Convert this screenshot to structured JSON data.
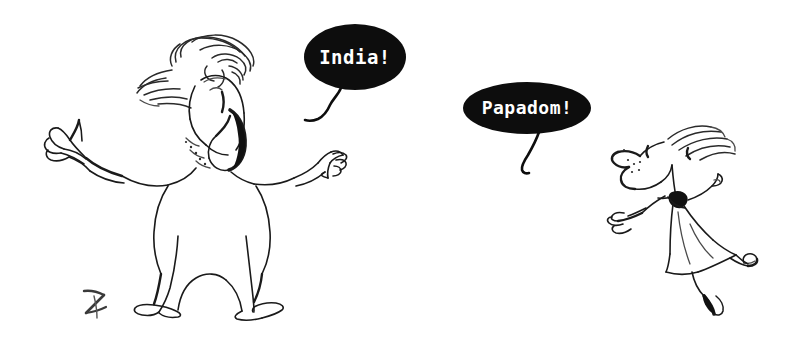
{
  "artwork": {
    "title": "India! / Papadom! cartoon sketch",
    "background_color": "#ffffff",
    "ink_color": "#1a1a1a",
    "width": 804,
    "height": 347
  },
  "speech_bubbles": [
    {
      "id": "bubble-india",
      "text": "India!",
      "fill_color": "#0d0d0d",
      "text_color": "#ffffff",
      "font_size": 19,
      "center_x": 355,
      "center_y": 57,
      "radius_x": 51,
      "radius_y": 33,
      "speaker": "adult-figure"
    },
    {
      "id": "bubble-papadom",
      "text": "Papadom!",
      "fill_color": "#0d0d0d",
      "text_color": "#ffffff",
      "font_size": 18,
      "center_x": 527,
      "center_y": 108,
      "radius_x": 64,
      "radius_y": 26,
      "speaker": "child-figure"
    }
  ],
  "figures": [
    {
      "id": "adult-figure",
      "label": "Adult figure shouting with arms outstretched",
      "position": "left"
    },
    {
      "id": "child-figure",
      "label": "Child figure in dress running and skipping",
      "position": "right"
    }
  ],
  "signature": {
    "mark": "Z",
    "label": "artist initial mark",
    "x": 92,
    "y": 300
  }
}
